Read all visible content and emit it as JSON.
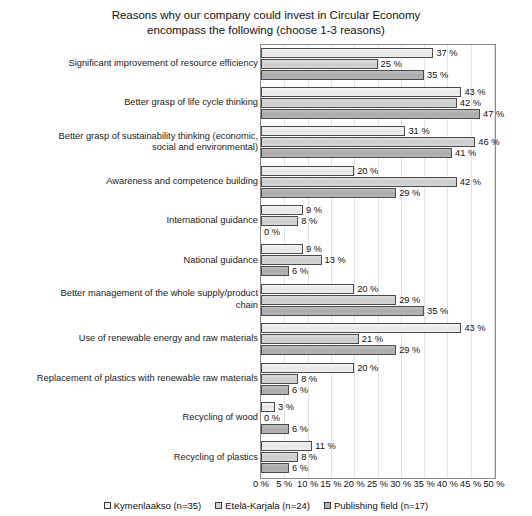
{
  "chart_data": {
    "type": "bar",
    "orientation": "horizontal",
    "title": "Reasons why our company could invest in Circular Economy encompass the following (choose 1-3 reasons)",
    "title_lines": [
      "Reasons why our company could invest in Circular Economy",
      "encompass the following (choose 1-3 reasons)"
    ],
    "xlabel": "",
    "ylabel": "",
    "xlim": [
      0,
      50
    ],
    "xtick_labels": [
      "0 %",
      "5 %",
      "10 %",
      "15 %",
      "20 %",
      "25 %",
      "30 %",
      "35 %",
      "40 %",
      "45 %",
      "50 %"
    ],
    "xtick_values": [
      0,
      5,
      10,
      15,
      20,
      25,
      30,
      35,
      40,
      45,
      50
    ],
    "grid": true,
    "legend_position": "bottom",
    "value_suffix": " %",
    "categories": [
      "Significant improvement of resource efficiency",
      "Better grasp of life cycle thinking",
      "Better grasp of sustainability thinking (economic, social and environmental)",
      "Awareness and competence building",
      "International guidance",
      "National guidance",
      "Better management of the whole supply/product chain",
      "Use of renewable energy and raw materials",
      "Replacement of plastics with renewable raw materials",
      "Recycling of wood",
      "Recycling of plastics"
    ],
    "category_lines": [
      [
        "Significant improvement of resource efficiency"
      ],
      [
        "Better grasp of life cycle thinking"
      ],
      [
        "Better grasp of sustainability thinking (economic,",
        "social and environmental)"
      ],
      [
        "Awareness and competence building"
      ],
      [
        "International guidance"
      ],
      [
        "National guidance"
      ],
      [
        "Better management of the whole supply/product",
        "chain"
      ],
      [
        "Use of renewable energy and raw materials"
      ],
      [
        "Replacement of plastics with renewable raw materials"
      ],
      [
        "Recycling of wood"
      ],
      [
        "Recycling of plastics"
      ]
    ],
    "series": [
      {
        "name": "Kymenlaakso (n=35)",
        "color": "#ebebeb",
        "values": [
          37,
          43,
          31,
          20,
          9,
          9,
          20,
          43,
          20,
          3,
          11
        ],
        "labels": [
          "37 %",
          "43 %",
          "31 %",
          "20 %",
          "9 %",
          "9 %",
          "20 %",
          "43 %",
          "20 %",
          "3 %",
          "11 %"
        ]
      },
      {
        "name": "Etelä-Karjala (n=24)",
        "color": "#d0d0d0",
        "values": [
          25,
          42,
          46,
          42,
          8,
          13,
          29,
          21,
          8,
          0,
          8
        ],
        "labels": [
          "25 %",
          "42 %",
          "46 %",
          "42 %",
          "8 %",
          "13 %",
          "29 %",
          "21 %",
          "8 %",
          "0 %",
          "8 %"
        ]
      },
      {
        "name": "Publishing field (n=17)",
        "color": "#b0b0b0",
        "values": [
          35,
          47,
          41,
          29,
          0,
          6,
          35,
          29,
          6,
          6,
          6
        ],
        "labels": [
          "35 %",
          "47 %",
          "41 %",
          "29 %",
          "0 %",
          "6 %",
          "35 %",
          "29 %",
          "6 %",
          "6 %",
          "6 %"
        ]
      }
    ]
  }
}
